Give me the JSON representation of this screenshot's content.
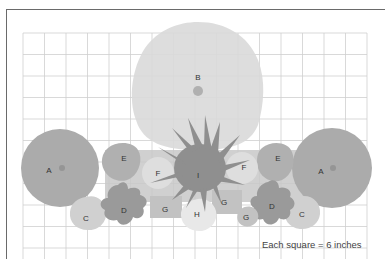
{
  "diagram": {
    "type": "garden planting plan",
    "scale_caption": "Each square = 6 inches",
    "grid": {
      "columns": 16,
      "rows": 10,
      "cell_px": 21.6
    },
    "colors": {
      "grid_line": "#cfcfcf",
      "plant_A": "#ababab",
      "plant_B": "#d9d9d9",
      "plant_C": "#d0d0d0",
      "plant_D": "#9a9a9a",
      "plant_E": "#b0b0b0",
      "plant_F": "#dedede",
      "plant_G": "#c2c2c2",
      "plant_H": "#e8e8e8",
      "plant_I": "#8f8f8f",
      "center_dot": "#959595"
    },
    "plants": [
      {
        "id": "A",
        "label": "A",
        "position": "left"
      },
      {
        "id": "A2",
        "label": "A",
        "position": "right"
      },
      {
        "id": "B",
        "label": "B",
        "position": "top-center"
      },
      {
        "id": "C",
        "label": "C",
        "position": "lower-left"
      },
      {
        "id": "C2",
        "label": "C",
        "position": "lower-right"
      },
      {
        "id": "D",
        "label": "D",
        "position": "lower-left"
      },
      {
        "id": "D2",
        "label": "D",
        "position": "lower-right"
      },
      {
        "id": "E",
        "label": "E",
        "position": "left"
      },
      {
        "id": "E2",
        "label": "E",
        "position": "right"
      },
      {
        "id": "F",
        "label": "F",
        "position": "center-left"
      },
      {
        "id": "F2",
        "label": "F",
        "position": "center-right"
      },
      {
        "id": "G",
        "label": "G",
        "position": "bottom-center-left"
      },
      {
        "id": "G2",
        "label": "G",
        "position": "center-right"
      },
      {
        "id": "G3",
        "label": "G",
        "position": "bottom-right"
      },
      {
        "id": "H",
        "label": "H",
        "position": "bottom-center"
      },
      {
        "id": "I",
        "label": "I",
        "position": "center"
      }
    ]
  }
}
